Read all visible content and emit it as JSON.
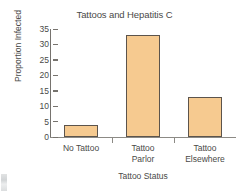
{
  "chart_data": {
    "type": "bar",
    "title": "Tattoos and Hepatitis C",
    "xlabel": "Tattoo Status",
    "ylabel": "Proportion Infected",
    "categories": [
      "No Tattoo",
      "Tattoo Parlor",
      "Tattoo Elsewhere"
    ],
    "category_lines": [
      [
        "No Tattoo"
      ],
      [
        "Tattoo",
        "Parlor"
      ],
      [
        "Tattoo",
        "Elsewhere"
      ]
    ],
    "values": [
      4,
      33,
      13
    ],
    "ylim": [
      0,
      35
    ],
    "ytick_labels": [
      "0",
      "5",
      "10",
      "15",
      "20",
      "25",
      "30",
      "35"
    ],
    "ytick_values": [
      0,
      5,
      10,
      15,
      20,
      25,
      30,
      35
    ],
    "grid": false,
    "legend": false,
    "bar_fill_color": "#F6CA90",
    "bar_edge_color": "#5C544C",
    "axis_color": "#8C8A85",
    "text_color": "#4A4A48",
    "background_color": "#FFFFFF"
  }
}
